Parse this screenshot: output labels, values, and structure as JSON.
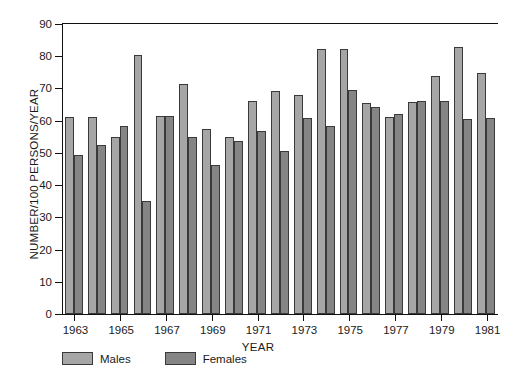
{
  "chart_data": {
    "type": "bar",
    "title": "",
    "xlabel": "YEAR",
    "ylabel": "NUMBER/100 PERSONS/YEAR",
    "ylim": [
      0,
      90
    ],
    "ytick_values": [
      0,
      10,
      20,
      30,
      40,
      50,
      60,
      70,
      80,
      90
    ],
    "grid": false,
    "legend_position": "below-left",
    "categories": [
      1963,
      1964,
      1965,
      1966,
      1967,
      1968,
      1969,
      1970,
      1971,
      1972,
      1973,
      1974,
      1975,
      1976,
      1977,
      1978,
      1979,
      1980,
      1981
    ],
    "xtick_labels": [
      "1963",
      "1965",
      "1967",
      "1969",
      "1971",
      "1973",
      "1975",
      "1977",
      "1979",
      "1981"
    ],
    "series": [
      {
        "name": "Males",
        "color": "#a6a6a6",
        "values": [
          61.0,
          61.2,
          54.8,
          80.5,
          61.5,
          71.5,
          57.5,
          54.8,
          66.2,
          69.3,
          68.0,
          82.3,
          82.3,
          65.5,
          61.2,
          65.8,
          74.0,
          83.0,
          74.8
        ]
      },
      {
        "name": "Females",
        "color": "#858585",
        "values": [
          49.5,
          52.3,
          58.3,
          35.0,
          61.6,
          55.0,
          46.2,
          53.7,
          56.7,
          50.5,
          60.8,
          58.5,
          69.5,
          64.3,
          62.0,
          66.0,
          66.0,
          60.5,
          60.8
        ]
      }
    ]
  },
  "legend": {
    "males_label": "Males",
    "females_label": "Females"
  },
  "axis": {
    "y_title": "NUMBER/100 PERSONS/YEAR",
    "x_title": "YEAR"
  }
}
